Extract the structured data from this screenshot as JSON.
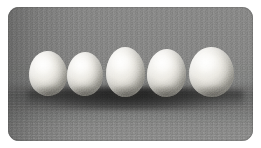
{
  "image": {
    "kind": "photograph",
    "subject": "five white chicken eggs in a row",
    "alt_text": "Five white eggs lined up side by side on a gray studio backdrop",
    "caption": "",
    "canvas": {
      "width_px": 261,
      "height_px": 148,
      "background_color": "#ffffff"
    },
    "frame": {
      "left_px": 8,
      "top_px": 7,
      "width_px": 245,
      "height_px": 134,
      "corner_radius_px": 11
    },
    "background": {
      "description": "neutral gray studio backdrop with a darker band on the left and a soft horizontal floor line",
      "top_color": "#8f8f8f",
      "mid_color": "#888888",
      "shadow_color": "#6e6e6e",
      "floor_color": "#949494",
      "left_vignette_color": "#4a4a4a"
    },
    "lighting": {
      "key_light_direction": "upper-left",
      "shadow_direction": "lower-right",
      "contact_shadow_color": "#1b1b1b"
    },
    "object_colors": {
      "shell_highlight": "#fdfdfb",
      "shell_midtone": "#ebe9e3",
      "shell_shadow": "#a3a19a"
    },
    "objects": [
      {
        "id": 1,
        "name": "egg",
        "label": "egg-1",
        "x_px": 21,
        "y_px": 44,
        "width_px": 38,
        "height_px": 45,
        "rotation_deg": -3
      },
      {
        "id": 2,
        "name": "egg",
        "label": "egg-2",
        "x_px": 59,
        "y_px": 45,
        "width_px": 36,
        "height_px": 44,
        "rotation_deg": 1
      },
      {
        "id": 3,
        "name": "egg",
        "label": "egg-3",
        "x_px": 98,
        "y_px": 40,
        "width_px": 39,
        "height_px": 50,
        "rotation_deg": -1
      },
      {
        "id": 4,
        "name": "egg",
        "label": "egg-4",
        "x_px": 139,
        "y_px": 42,
        "width_px": 39,
        "height_px": 48,
        "rotation_deg": 2
      },
      {
        "id": 5,
        "name": "egg",
        "label": "egg-5",
        "x_px": 181,
        "y_px": 40,
        "width_px": 45,
        "height_px": 50,
        "rotation_deg": -2
      }
    ],
    "object_count": 5
  }
}
